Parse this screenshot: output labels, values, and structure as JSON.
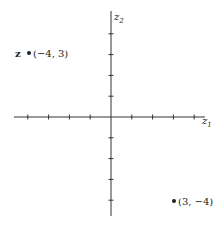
{
  "diagram": {
    "type": "complex-plane",
    "axes": {
      "horizontal_label": "z",
      "horizontal_subscript": "1",
      "vertical_label": "z",
      "vertical_subscript": "2",
      "tick_range": [
        -4,
        4
      ]
    },
    "points": [
      {
        "name": "z",
        "coords": "(−4, 3)",
        "x": -4,
        "y": 3
      },
      {
        "name": "",
        "coords": "(3, −4)",
        "x": 3,
        "y": -4
      }
    ],
    "colors": {
      "ink": "#222222",
      "background": "#ffffff"
    }
  }
}
